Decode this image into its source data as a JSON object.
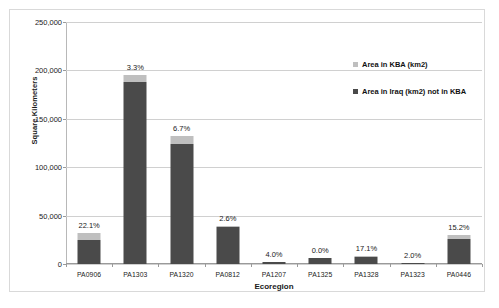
{
  "chart_data": {
    "type": "bar",
    "subtype": "stacked-column",
    "title": "",
    "xlabel": "Ecoregion",
    "ylabel": "Square Kilometers",
    "categories": [
      "PA0906",
      "PA1303",
      "PA1320",
      "PA0812",
      "PA1207",
      "PA1325",
      "PA1328",
      "PA1323",
      "PA0446"
    ],
    "series": [
      {
        "name": "Area in Iraq (km2) not in KBA",
        "color": "#4a4a4a",
        "values": [
          25000,
          188500,
          123500,
          38000,
          1800,
          6000,
          7200,
          1300,
          25800
        ]
      },
      {
        "name": "Area in KBA (km2)",
        "color": "#bfbfbf",
        "values": [
          7100,
          6400,
          8900,
          1000,
          75,
          0,
          1500,
          27,
          4600
        ]
      }
    ],
    "data_labels": [
      "22.1%",
      "3.3%",
      "6.7%",
      "2.6%",
      "4.0%",
      "0.0%",
      "17.1%",
      "2.0%",
      "15.2%"
    ],
    "totals": [
      32100,
      194900,
      132400,
      39000,
      1875,
      6000,
      8700,
      1327,
      30400
    ],
    "ylim": [
      0,
      250000
    ],
    "ytick_labels": [
      "0",
      "50,000",
      "100,000",
      "150,000",
      "200,000",
      "250,000"
    ],
    "ytick_values": [
      0,
      50000,
      100000,
      150000,
      200000,
      250000
    ],
    "grid": true,
    "legend_position": "right-inside"
  },
  "legend": {
    "entries": [
      {
        "label": "Area in KBA (km2)",
        "swatch_class": "kba"
      },
      {
        "label": "Area in Iraq (km2) not in KBA",
        "swatch_class": "notkba"
      }
    ]
  },
  "colors": {
    "bar_dark": "#4a4a4a",
    "bar_light": "#bfbfbf",
    "gridline": "#d0d0d0",
    "frame": "#d9d9d9"
  }
}
